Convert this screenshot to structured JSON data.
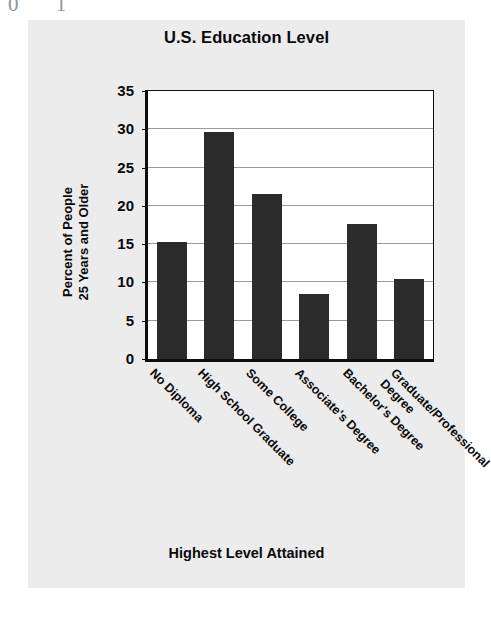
{
  "artifact": {
    "top_fragment": "0 1"
  },
  "chart_data": {
    "type": "bar",
    "title": "U.S. Education Level",
    "xlabel": "Highest Level Attained",
    "ylabel": "Percent of People 25 Years and Older",
    "ylabel_lines": [
      "Percent of People",
      "25 Years and Older"
    ],
    "categories": [
      "No Diploma",
      "High School Graduate",
      "Some College",
      "Associate's Degree",
      "Bachelor's Degree",
      "Graduate/Professional Degree"
    ],
    "category_lines": [
      [
        "No Diploma"
      ],
      [
        "High School Graduate"
      ],
      [
        "Some College"
      ],
      [
        "Associate's Degree"
      ],
      [
        "Bachelor's Degree"
      ],
      [
        "Graduate/Professional",
        "Degree"
      ]
    ],
    "values": [
      15.3,
      29.6,
      21.5,
      8.5,
      17.6,
      10.4
    ],
    "ylim": [
      0,
      35
    ],
    "ytick_values": [
      0,
      5,
      10,
      15,
      20,
      25,
      30,
      35
    ],
    "ytick_labels": [
      "0",
      "5",
      "10",
      "15",
      "20",
      "25",
      "30",
      "35"
    ],
    "grid": true,
    "legend": false,
    "bar_color": "#2b2b2b",
    "plot_background": "#ffffff",
    "figure_background": "#ececed"
  }
}
